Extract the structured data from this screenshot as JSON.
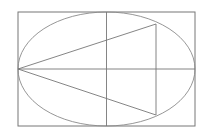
{
  "diagram": {
    "type": "geometric-construction",
    "colors": {
      "background": "#ffffff",
      "stroke": "#777777",
      "ellipse": "#8a8a8a"
    },
    "rect": {
      "x": 18,
      "y": 12,
      "width": 177,
      "height": 114
    },
    "ellipse": {
      "cx": 106.5,
      "cy": 69,
      "rx": 88.5,
      "ry": 57
    },
    "lines": [
      {
        "name": "major-axis",
        "x1": 18,
        "y1": 69,
        "x2": 195,
        "y2": 69
      },
      {
        "name": "minor-axis",
        "x1": 106.5,
        "y1": 12,
        "x2": 106.5,
        "y2": 126
      },
      {
        "name": "upper-chord",
        "x1": 18,
        "y1": 69,
        "x2": 156,
        "y2": 24
      },
      {
        "name": "lower-chord",
        "x1": 18,
        "y1": 69,
        "x2": 156,
        "y2": 115
      },
      {
        "name": "vertical-chord",
        "x1": 156,
        "y1": 24,
        "x2": 156,
        "y2": 115
      }
    ]
  }
}
